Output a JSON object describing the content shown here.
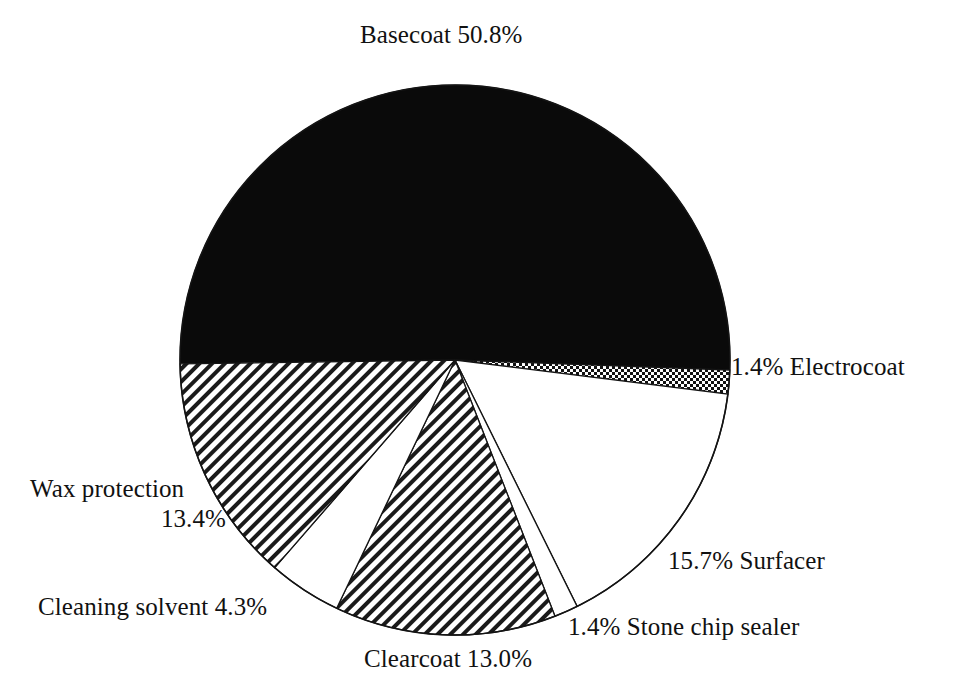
{
  "figure": {
    "background_color": "#ffffff",
    "ink_color": "#111111"
  },
  "chart_data": {
    "type": "pie",
    "title": "",
    "subtitle": "",
    "xlabel": "",
    "ylabel": "",
    "legend_position": "none",
    "grid": false,
    "units": "percent",
    "total": 100.0,
    "start_angle_deg": 179.2,
    "direction": "clockwise",
    "center": {
      "x": 455,
      "y": 360
    },
    "radius": 275,
    "categories": [
      "Basecoat",
      "Electrocoat",
      "Surfacer",
      "Stone chip sealer",
      "Clearcoat",
      "Cleaning solvent",
      "Wax protection"
    ],
    "values": [
      50.8,
      1.4,
      15.7,
      1.4,
      13.0,
      4.3,
      13.4
    ],
    "slices": [
      {
        "name": "Basecoat",
        "value": 50.8,
        "value_text": "50.8%",
        "label_text": "Basecoat 50.8%",
        "fill": "solid-black",
        "fill_color": "#0a0a0a",
        "label_position": "top"
      },
      {
        "name": "Electrocoat",
        "value": 1.4,
        "value_text": "1.4%",
        "label_text": "1.4% Electrocoat",
        "fill": "checker-dots",
        "fill_color": "#111111",
        "label_position": "right"
      },
      {
        "name": "Surfacer",
        "value": 15.7,
        "value_text": "15.7%",
        "label_text": "15.7% Surfacer",
        "fill": "white",
        "fill_color": "#ffffff",
        "label_position": "lower-right"
      },
      {
        "name": "Stone chip sealer",
        "value": 1.4,
        "value_text": "1.4%",
        "label_text": "1.4% Stone chip sealer",
        "fill": "white",
        "fill_color": "#ffffff",
        "label_position": "bottom-right"
      },
      {
        "name": "Clearcoat",
        "value": 13.0,
        "value_text": "13.0%",
        "label_text": "Clearcoat 13.0%",
        "fill": "diagonal-hatch",
        "fill_color": "#111111",
        "label_position": "bottom"
      },
      {
        "name": "Cleaning solvent",
        "value": 4.3,
        "value_text": "4.3%",
        "label_text": "Cleaning solvent 4.3%",
        "fill": "white",
        "fill_color": "#ffffff",
        "label_position": "bottom-left"
      },
      {
        "name": "Wax protection",
        "value": 13.4,
        "value_text": "13.4%",
        "label_text": "Wax protection 13.4%",
        "label_line1": "Wax protection",
        "label_line2": "13.4%",
        "fill": "diagonal-hatch",
        "fill_color": "#111111",
        "label_position": "left"
      }
    ]
  },
  "labels": {
    "basecoat": "Basecoat 50.8%",
    "electrocoat": "1.4% Electrocoat",
    "surfacer": "15.7% Surfacer",
    "stone_chip_sealer": "1.4% Stone chip sealer",
    "clearcoat": "Clearcoat 13.0%",
    "cleaning_solvent": "Cleaning solvent 4.3%",
    "wax_protection_line1": "Wax protection",
    "wax_protection_line2": "13.4%"
  }
}
